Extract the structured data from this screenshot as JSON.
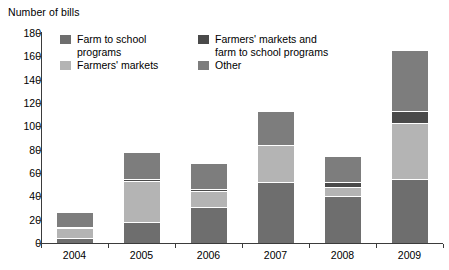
{
  "chart_data": {
    "type": "bar",
    "stacked": true,
    "title": "",
    "ylabel": "Number of bills",
    "xlabel": "",
    "ylim": [
      0,
      180
    ],
    "ytick_step": 20,
    "grid": false,
    "legend_position": "top-inside",
    "yticks": [
      "180",
      "160",
      "140",
      "120",
      "100",
      "80",
      "60",
      "40",
      "20",
      "0"
    ],
    "categories": [
      "2004",
      "2005",
      "2006",
      "2007",
      "2008",
      "2009"
    ],
    "series": [
      {
        "name": "Farm to school programs",
        "color": "#6e6e6e",
        "values": [
          4,
          18,
          31,
          52,
          40,
          55
        ]
      },
      {
        "name": "Farmers' markets",
        "color": "#b4b4b4",
        "values": [
          9,
          35,
          14,
          32,
          8,
          48
        ]
      },
      {
        "name": "Farmers' markets and farm to school programs",
        "color": "#4a4a4a",
        "values": [
          1,
          2,
          1,
          0,
          4,
          10
        ]
      },
      {
        "name": "Other",
        "color": "#7d7d7d",
        "values": [
          12,
          22,
          22,
          28,
          22,
          52
        ]
      }
    ],
    "totals": [
      26,
      77,
      68,
      112,
      74,
      165
    ]
  },
  "legend": {
    "items": [
      {
        "label_line1": "Farm to school",
        "label_line2": "programs",
        "color": "#6e6e6e"
      },
      {
        "label_line1": "Farmers' markets",
        "label_line2": "",
        "color": "#b4b4b4"
      },
      {
        "label_line1": "Farmers' markets and",
        "label_line2": "farm to school programs",
        "color": "#4a4a4a"
      },
      {
        "label_line1": "Other",
        "label_line2": "",
        "color": "#7d7d7d"
      }
    ]
  }
}
